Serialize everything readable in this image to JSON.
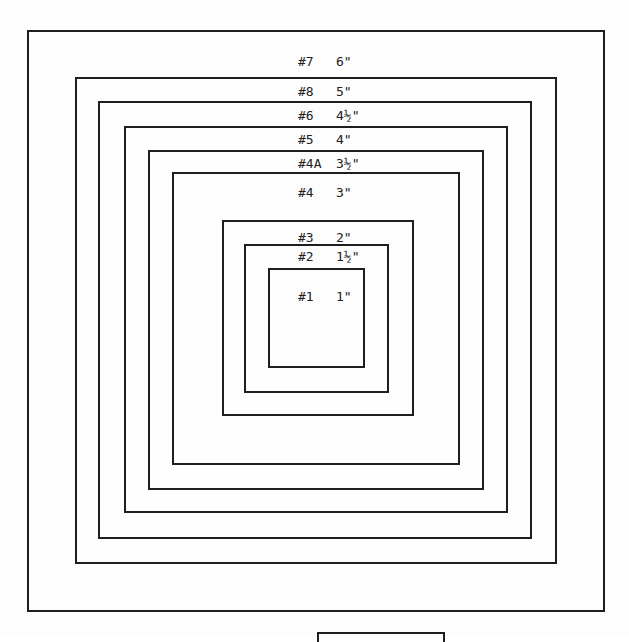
{
  "diagram": {
    "boxes": [
      {
        "id": "outer-frame",
        "left": 27,
        "top": 30,
        "right": 605,
        "bottom": 612
      },
      {
        "id": "box-6in",
        "left": 75,
        "top": 77,
        "right": 557,
        "bottom": 564
      },
      {
        "id": "box-5in",
        "left": 98,
        "top": 101,
        "right": 532,
        "bottom": 539
      },
      {
        "id": "box-4-5in",
        "left": 124,
        "top": 126,
        "right": 508,
        "bottom": 513
      },
      {
        "id": "box-4in",
        "left": 148,
        "top": 150,
        "right": 484,
        "bottom": 490
      },
      {
        "id": "box-3-5in",
        "left": 172,
        "top": 172,
        "right": 460,
        "bottom": 465
      },
      {
        "id": "box-2in",
        "left": 222,
        "top": 220,
        "right": 414,
        "bottom": 416
      },
      {
        "id": "box-1-5in",
        "left": 244,
        "top": 244,
        "right": 389,
        "bottom": 393
      },
      {
        "id": "box-1in",
        "left": 268,
        "top": 268,
        "right": 365,
        "bottom": 368
      }
    ],
    "labels": [
      {
        "number": "#7",
        "size": "6\"",
        "top": 55
      },
      {
        "number": "#8",
        "size": "5\"",
        "top": 85
      },
      {
        "number": "#6",
        "size": "4½\"",
        "top": 109
      },
      {
        "number": "#5",
        "size": "4\"",
        "top": 133
      },
      {
        "number": "#4A",
        "size": "3½\"",
        "top": 157
      },
      {
        "number": "#4",
        "size": "3\"",
        "top": 186
      },
      {
        "number": "#3",
        "size": "2\"",
        "top": 231
      },
      {
        "number": "#2",
        "size": "1½\"",
        "top": 250
      },
      {
        "number": "#1",
        "size": "1\"",
        "top": 290
      }
    ],
    "footer_box": {
      "left": 317,
      "top": 632,
      "right": 445
    }
  }
}
